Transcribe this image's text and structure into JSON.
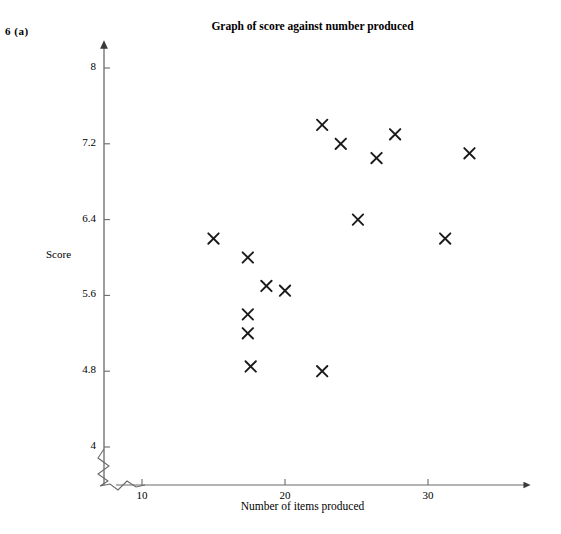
{
  "question": {
    "number": "6",
    "part": "(a)",
    "label": "6  (a)"
  },
  "chart_data": {
    "type": "scatter",
    "title": "Graph of score against number produced",
    "xlabel": "Number of items produced",
    "ylabel": "Score",
    "xlim": [
      8.6,
      34.5
    ],
    "ylim": [
      3.75,
      8.3
    ],
    "xticks": [
      10,
      20,
      30
    ],
    "xtick_labels": [
      "10",
      "20",
      "30"
    ],
    "yticks": [
      4,
      4.8,
      5.6,
      6.4,
      7.2,
      8
    ],
    "ytick_labels": [
      "4",
      "4.8",
      "5.6",
      "6.4",
      "7.2",
      "8"
    ],
    "grid": false,
    "legend": null,
    "marker": "x",
    "marker_color": "#1a1a1a",
    "axis_color": "#5a5a5a",
    "x_axis_break": true,
    "n_points": 16,
    "points": [
      {
        "x": 15.0,
        "y": 6.2
      },
      {
        "x": 17.4,
        "y": 5.2
      },
      {
        "x": 17.4,
        "y": 6.0
      },
      {
        "x": 17.4,
        "y": 5.4
      },
      {
        "x": 17.6,
        "y": 4.85
      },
      {
        "x": 18.7,
        "y": 5.7
      },
      {
        "x": 20.0,
        "y": 5.65
      },
      {
        "x": 22.6,
        "y": 4.8
      },
      {
        "x": 22.6,
        "y": 7.4
      },
      {
        "x": 23.9,
        "y": 7.2
      },
      {
        "x": 25.1,
        "y": 6.4
      },
      {
        "x": 26.4,
        "y": 7.05
      },
      {
        "x": 27.7,
        "y": 7.3
      },
      {
        "x": 31.2,
        "y": 6.2
      },
      {
        "x": 32.9,
        "y": 7.1
      }
    ]
  }
}
